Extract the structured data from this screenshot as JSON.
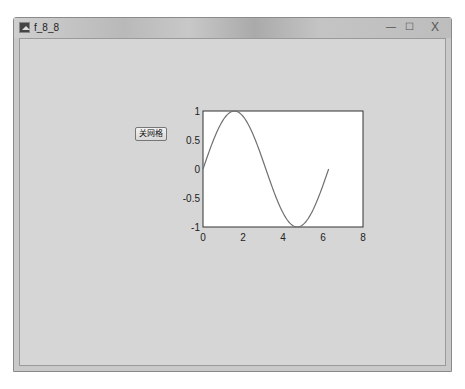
{
  "window": {
    "title": "f_8_8",
    "controls": {
      "minimize": "—",
      "maximize": "☐",
      "close": "X"
    }
  },
  "figure": {
    "button_label": "关网格"
  },
  "chart_data": {
    "type": "line",
    "title": "",
    "xlabel": "",
    "ylabel": "",
    "xlim": [
      0,
      8
    ],
    "ylim": [
      -1,
      1
    ],
    "xticks": [
      "0",
      "2",
      "4",
      "6",
      "8"
    ],
    "yticks": [
      "1",
      "0.5",
      "0",
      "-0.5",
      "-1"
    ],
    "grid": false,
    "series": [
      {
        "name": "sin(x)",
        "function": "y = sin(x), x from 0 to 2π",
        "x": [
          0,
          0.5,
          1.0,
          1.5708,
          2.0,
          2.5,
          3.0,
          3.1416,
          3.5,
          4.0,
          4.5,
          4.7124,
          5.0,
          5.5,
          6.0,
          6.2832
        ],
        "values": [
          0,
          0.479,
          0.841,
          1.0,
          0.909,
          0.598,
          0.141,
          0,
          -0.351,
          -0.757,
          -0.978,
          -1.0,
          -0.959,
          -0.706,
          -0.279,
          0
        ],
        "color": "#707070"
      }
    ]
  }
}
